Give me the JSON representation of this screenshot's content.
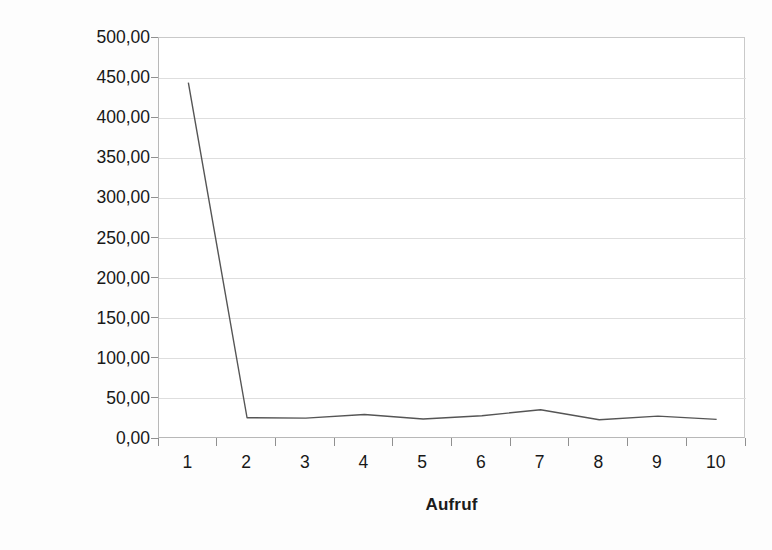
{
  "chart_data": {
    "type": "line",
    "title": "",
    "xlabel": "Aufruf",
    "ylabel": "Antwortzeit [ms]",
    "categories": [
      "1",
      "2",
      "3",
      "4",
      "5",
      "6",
      "7",
      "8",
      "9",
      "10"
    ],
    "values": [
      444.5,
      26.5,
      26.0,
      30.5,
      25.0,
      29.0,
      36.5,
      24.0,
      28.5,
      24.5
    ],
    "series": [
      {
        "name": "Antwortzeit",
        "values": [
          444.5,
          26.5,
          26.0,
          30.5,
          25.0,
          29.0,
          36.5,
          24.0,
          28.5,
          24.5
        ]
      }
    ],
    "ylim": [
      0,
      500
    ],
    "ytick_step": 50,
    "ytick_labels": [
      "0,00",
      "50,00",
      "100,00",
      "150,00",
      "200,00",
      "250,00",
      "300,00",
      "350,00",
      "400,00",
      "450,00",
      "500,00"
    ],
    "ytick_values": [
      0,
      50,
      100,
      150,
      200,
      250,
      300,
      350,
      400,
      450,
      500
    ],
    "grid": "horizontal",
    "legend": "none",
    "line_color": "#555555",
    "grid_color": "#dedede",
    "axis_color": "#b8b8b8",
    "plot_background": "#ffffff",
    "figure_background": "#fdfdfd",
    "decimal_separator": ","
  }
}
